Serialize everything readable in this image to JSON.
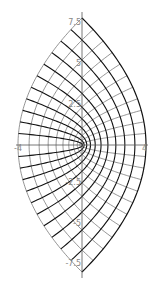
{
  "diagram": {
    "origin_px": [
      82,
      145
    ],
    "scale_px_per_unit": 16.5,
    "axis": {
      "color": "#555555",
      "y_ticks": [
        {
          "value": 7.5,
          "label": "7.5"
        },
        {
          "value": 5,
          "label": "5"
        },
        {
          "value": 2.5,
          "label": "2.5"
        },
        {
          "value": -2.5,
          "label": "-2.5"
        },
        {
          "value": -5,
          "label": "-5"
        },
        {
          "value": -7.5,
          "label": "-7.5"
        }
      ],
      "x_ticks": [
        {
          "value": -4,
          "label": "-4"
        },
        {
          "value": 4,
          "label": "4"
        }
      ]
    },
    "grid": {
      "thick_color": "#111111",
      "thin_color": "#666666",
      "u_max": 2.75,
      "v_max": 2.75,
      "steps": 11
    }
  }
}
